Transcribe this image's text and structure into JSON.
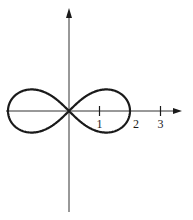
{
  "diagram": {
    "type": "lemniscate-plot",
    "curve": {
      "name": "lemniscate of Bernoulli",
      "equation_polar": "r^2 = 4 cos(2θ)",
      "a": 2,
      "stroke_color": "#1a1a1a",
      "stroke_width": 2.2
    },
    "axes": {
      "color": "#333333",
      "x_arrow": true,
      "y_arrow": true
    },
    "x_ticks": [
      {
        "value": 1,
        "label": "1"
      },
      {
        "value": 2,
        "label": "2"
      },
      {
        "value": 3,
        "label": "3"
      }
    ]
  },
  "layout": {
    "origin_x": 69,
    "origin_y": 111,
    "unit_px": 30.5,
    "x_axis_start": 6,
    "x_axis_end": 182,
    "y_axis_top": 8,
    "y_axis_bottom": 212
  }
}
